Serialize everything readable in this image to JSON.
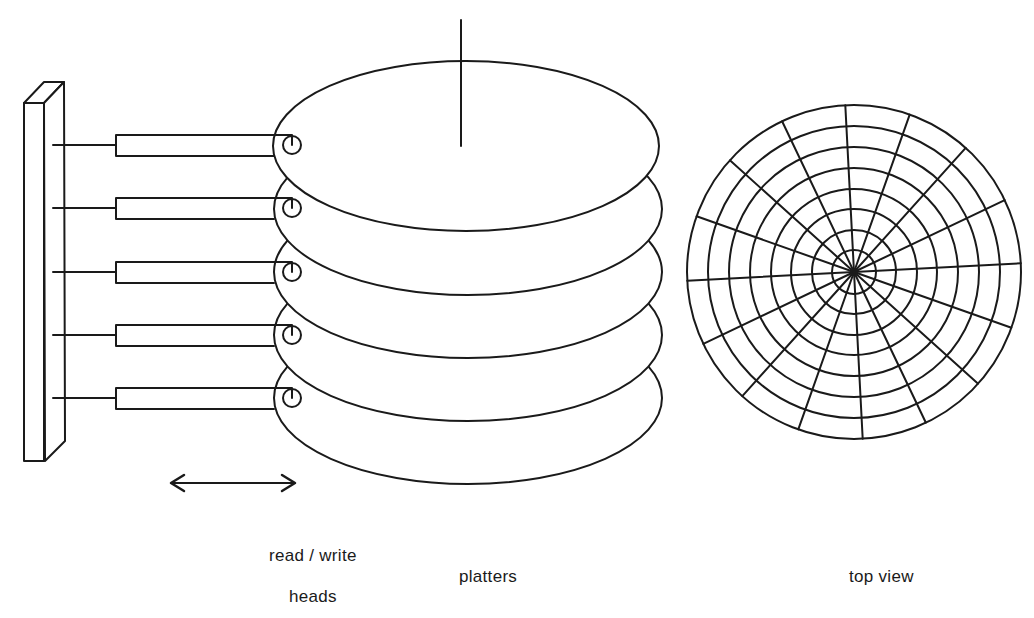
{
  "colors": {
    "stroke": "#1a1a1a",
    "background": "#ffffff"
  },
  "labels": {
    "heads_line1": "read / write",
    "heads_line2": "heads",
    "platters": "platters",
    "top_view": "top view"
  },
  "actuator": {
    "platter_count": 5,
    "head_count": 5,
    "movement": "bidirectional-arrow"
  },
  "top_view": {
    "track_count": 8,
    "sector_count": 16
  }
}
